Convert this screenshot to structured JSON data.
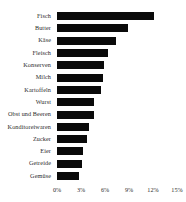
{
  "chart_data": {
    "type": "bar",
    "orientation": "horizontal",
    "title": "",
    "subtitle": "",
    "xlabel": "",
    "ylabel": "",
    "xlim": [
      0,
      15
    ],
    "xticks": [
      0,
      3,
      6,
      9,
      12,
      15
    ],
    "xtick_labels": [
      "0%",
      "3%",
      "6%",
      "9%",
      "12%",
      "15%"
    ],
    "grid": false,
    "legend": null,
    "value_suffix": "%",
    "bar_color": "#0a0a0a",
    "background_color": "#ffffff",
    "categories": [
      "Fisch",
      "Butter",
      "Käse",
      "Fleisch",
      "Konserven",
      "Milch",
      "Kartoffeln",
      "Wurst",
      "Obst und Beeren",
      "Konditoreiwaren",
      "Zucker",
      "Eier",
      "Getreide",
      "Gemüse"
    ],
    "values": [
      12.1,
      8.9,
      7.4,
      6.4,
      5.9,
      5.7,
      5.5,
      4.6,
      4.6,
      4.0,
      3.7,
      3.3,
      3.1,
      2.8
    ]
  }
}
